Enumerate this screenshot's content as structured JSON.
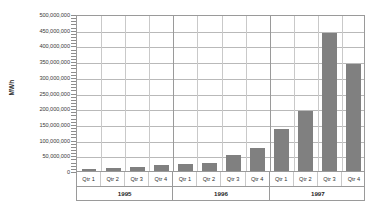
{
  "chart_data": {
    "type": "bar",
    "title": "",
    "xlabel": "",
    "ylabel": "MWh",
    "ylim": [
      0,
      500000000
    ],
    "ytick_step": 50000000,
    "minor_tick_step": 10000000,
    "grid": true,
    "legend": null,
    "bar_color": "#808080",
    "categories": [
      "Qtr 1",
      "Qtr 2",
      "Qtr 3",
      "Qtr 4",
      "Qtr 1",
      "Qtr 2",
      "Qtr 3",
      "Qtr 4",
      "Qtr 1",
      "Qtr 2",
      "Qtr 3",
      "Qtr 4"
    ],
    "values": [
      5000000,
      10000000,
      14000000,
      18000000,
      22000000,
      27000000,
      50000000,
      72000000,
      135000000,
      190000000,
      440000000,
      340000000
    ],
    "groups": [
      {
        "label": "1995",
        "start": 0,
        "count": 4
      },
      {
        "label": "1996",
        "start": 4,
        "count": 4
      },
      {
        "label": "1997",
        "start": 8,
        "count": 4
      }
    ],
    "ytick_labels": [
      "500,000,000",
      "450,000,000",
      "400,000,000",
      "350,000,000",
      "300,000,000",
      "250,000,000",
      "200,000,000",
      "150,000,000",
      "100,000,000",
      "50,000,000",
      "0"
    ],
    "ytick_values": [
      500000000,
      450000000,
      400000000,
      350000000,
      300000000,
      250000000,
      200000000,
      150000000,
      100000000,
      50000000,
      0
    ]
  }
}
